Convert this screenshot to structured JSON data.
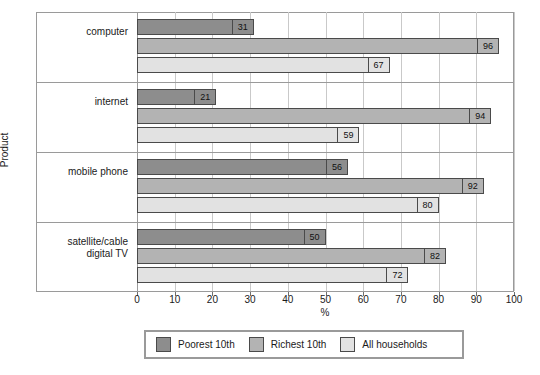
{
  "chart_data": {
    "type": "bar",
    "orientation": "horizontal",
    "title": "",
    "xlabel": "%",
    "ylabel": "Product",
    "xlim": [
      0,
      100
    ],
    "xticks": [
      0,
      10,
      20,
      30,
      40,
      50,
      60,
      70,
      80,
      90,
      100
    ],
    "grid": true,
    "legend_position": "bottom",
    "categories": [
      "computer",
      "internet",
      "mobile phone",
      "satellite/cable digital TV"
    ],
    "series": [
      {
        "name": "Poorest 10th",
        "color": "#8d8d8d",
        "values": [
          31,
          21,
          56,
          50
        ]
      },
      {
        "name": "Richest 10th",
        "color": "#b3b3b3",
        "values": [
          96,
          94,
          92,
          82
        ]
      },
      {
        "name": "All households",
        "color": "#e2e2e2",
        "values": [
          67,
          59,
          80,
          72
        ]
      }
    ]
  },
  "axis": {
    "x_label": "%",
    "y_label": "Product",
    "x_tick_labels": [
      "0",
      "10",
      "20",
      "30",
      "40",
      "50",
      "60",
      "70",
      "80",
      "90",
      "100"
    ]
  },
  "legend": {
    "items": [
      {
        "label": "Poorest 10th",
        "swatch": "s0"
      },
      {
        "label": "Richest 10th",
        "swatch": "s1"
      },
      {
        "label": "All households",
        "swatch": "s2"
      }
    ]
  },
  "colors": {
    "series_poorest": "#8d8d8d",
    "series_richest": "#b3b3b3",
    "series_all": "#e2e2e2",
    "frame": "#9a9a9a",
    "grid": "#c9c9c9",
    "bar_outline": "#4a4a4a"
  }
}
